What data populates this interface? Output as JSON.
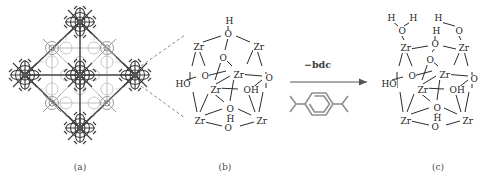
{
  "figure": {
    "background_color": "#ffffff",
    "line_color": "#2b2b2b",
    "lattice_color_dark": "#4d4d4d",
    "lattice_color_light": "#b8b8b8",
    "dashed_color": "#6b6b6b",
    "label_color": "#1d1d1d",
    "caption_color": "#4a4a4a"
  },
  "panels": [
    {
      "id": "a",
      "caption": "(a)",
      "description": "UiO-66 framework lattice of Zr6 nodes bridged by bdc linkers"
    },
    {
      "id": "b",
      "caption": "(b)",
      "description": "Zr6O4(OH)4 cluster secondary building unit"
    },
    {
      "id": "c",
      "caption": "(c)",
      "description": "Zr6 cluster after bdc removal with coordinated water"
    }
  ],
  "reaction": {
    "label": "−bdc",
    "linker_name": "bdc",
    "arrow": "right-arrow"
  },
  "cluster_b": {
    "labels": [
      {
        "text": "H",
        "x": 225,
        "y": 17
      },
      {
        "text": "O",
        "x": 224,
        "y": 30
      },
      {
        "text": "Zr",
        "x": 193,
        "y": 43
      },
      {
        "text": "Zr",
        "x": 253,
        "y": 43
      },
      {
        "text": "O",
        "x": 219,
        "y": 54
      },
      {
        "text": "Zr",
        "x": 233,
        "y": 71
      },
      {
        "text": "O",
        "x": 201,
        "y": 72
      },
      {
        "text": "HO",
        "x": 175,
        "y": 80
      },
      {
        "text": "O",
        "x": 265,
        "y": 74
      },
      {
        "text": "Zr",
        "x": 210,
        "y": 86
      },
      {
        "text": "OH",
        "x": 243,
        "y": 86
      },
      {
        "text": "O",
        "x": 226,
        "y": 105
      },
      {
        "text": "H",
        "x": 226,
        "y": 115
      },
      {
        "text": "Zr",
        "x": 194,
        "y": 117
      },
      {
        "text": "Zr",
        "x": 256,
        "y": 117
      },
      {
        "text": "O",
        "x": 224,
        "y": 124
      }
    ]
  },
  "cluster_c": {
    "labels": [
      {
        "text": "H",
        "x": 387,
        "y": 14
      },
      {
        "text": "H",
        "x": 409,
        "y": 14
      },
      {
        "text": "O",
        "x": 398,
        "y": 27
      },
      {
        "text": "H",
        "x": 434,
        "y": 14
      },
      {
        "text": "O",
        "x": 455,
        "y": 27
      },
      {
        "text": "H",
        "x": 432,
        "y": 27
      },
      {
        "text": "O",
        "x": 431,
        "y": 40
      },
      {
        "text": "Zr",
        "x": 400,
        "y": 44
      },
      {
        "text": "Zr",
        "x": 458,
        "y": 44
      },
      {
        "text": "O",
        "x": 426,
        "y": 56
      },
      {
        "text": "Zr",
        "x": 439,
        "y": 71
      },
      {
        "text": "O",
        "x": 408,
        "y": 72
      },
      {
        "text": "HO",
        "x": 381,
        "y": 80
      },
      {
        "text": "O",
        "x": 470,
        "y": 75
      },
      {
        "text": "Zr",
        "x": 417,
        "y": 86
      },
      {
        "text": "OH",
        "x": 449,
        "y": 86
      },
      {
        "text": "O",
        "x": 433,
        "y": 104
      },
      {
        "text": "H",
        "x": 433,
        "y": 114
      },
      {
        "text": "Zr",
        "x": 400,
        "y": 117
      },
      {
        "text": "Zr",
        "x": 462,
        "y": 117
      },
      {
        "text": "O",
        "x": 431,
        "y": 123
      }
    ]
  }
}
